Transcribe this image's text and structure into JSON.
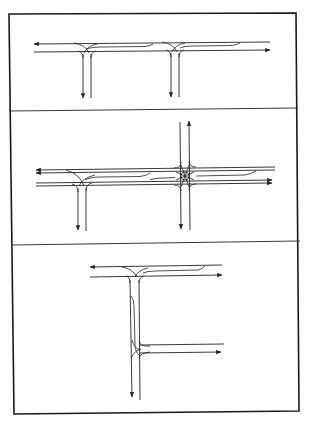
{
  "figure": {
    "colors": {
      "ink": "#222222",
      "background": "#ffffff",
      "frame": "#1a1a1a"
    },
    "frame": {
      "left": 9,
      "top": 14,
      "right": 299,
      "bottom": 413
    },
    "dividers": [
      {
        "x1": 9,
        "y1": 111,
        "x2": 298,
        "y2": 108
      },
      {
        "x1": 11,
        "y1": 245,
        "x2": 300,
        "y2": 241
      }
    ],
    "panels": [
      {
        "id": "panel-1",
        "label": "two-t-junctions",
        "junctions": 2,
        "type": "tee"
      },
      {
        "id": "panel-2",
        "label": "tee-and-crossroads",
        "junctions": 2,
        "type": "tee+cross"
      },
      {
        "id": "panel-3",
        "label": "stacked-tee-junctions",
        "junctions": 2,
        "type": "tee-vertical"
      }
    ]
  }
}
